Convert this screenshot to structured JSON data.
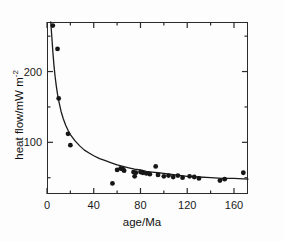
{
  "chart_data": {
    "type": "scatter",
    "title": "",
    "xlabel": "age/Ma",
    "ylabel": "heat flow/mW m",
    "ylabel_exponent": "-2",
    "xlim": [
      0,
      172
    ],
    "ylim": [
      27,
      270
    ],
    "xticks": [
      0,
      40,
      80,
      120,
      160
    ],
    "xticklabels": [
      "0",
      "40",
      "80",
      "120",
      "160"
    ],
    "xminorticks": [
      20,
      60,
      100,
      140
    ],
    "yticks": [
      100,
      200
    ],
    "yticklabels": [
      "100",
      "200"
    ],
    "yminorticks": [
      50,
      150,
      250
    ],
    "grid": false,
    "legend": null,
    "frame": "box",
    "series": [
      {
        "name": "heat flow observations",
        "marker": "filled-circle",
        "color": "#161616",
        "points": [
          [
            5,
            265
          ],
          [
            9,
            232
          ],
          [
            10,
            162
          ],
          [
            18,
            112
          ],
          [
            20,
            96
          ],
          [
            56,
            42
          ],
          [
            60,
            61
          ],
          [
            63,
            63
          ],
          [
            65,
            62
          ],
          [
            66,
            60
          ],
          [
            74,
            58
          ],
          [
            75,
            52
          ],
          [
            76,
            57
          ],
          [
            80,
            58
          ],
          [
            82,
            57
          ],
          [
            85,
            56
          ],
          [
            88,
            55
          ],
          [
            93,
            66
          ],
          [
            95,
            54
          ],
          [
            100,
            52
          ],
          [
            104,
            53
          ],
          [
            108,
            51
          ],
          [
            112,
            53
          ],
          [
            116,
            50
          ],
          [
            122,
            52
          ],
          [
            126,
            51
          ],
          [
            130,
            49
          ],
          [
            148,
            46
          ],
          [
            152,
            48
          ],
          [
            168,
            57
          ]
        ]
      },
      {
        "name": "theoretical cooling curve",
        "type": "line",
        "color": "#1b1b1b",
        "points": [
          [
            3.2,
            270
          ],
          [
            4,
            252
          ],
          [
            5,
            228
          ],
          [
            6,
            208
          ],
          [
            7,
            192
          ],
          [
            8,
            179
          ],
          [
            9,
            168
          ],
          [
            10,
            159
          ],
          [
            12,
            144
          ],
          [
            14,
            133
          ],
          [
            16,
            124
          ],
          [
            18,
            117
          ],
          [
            20,
            111
          ],
          [
            24,
            102
          ],
          [
            28,
            95
          ],
          [
            32,
            89
          ],
          [
            36,
            85
          ],
          [
            40,
            81
          ],
          [
            45,
            77
          ],
          [
            50,
            74
          ],
          [
            55,
            71
          ],
          [
            60,
            68
          ],
          [
            65,
            66
          ],
          [
            70,
            64
          ],
          [
            75,
            62
          ],
          [
            80,
            61
          ],
          [
            85,
            59
          ],
          [
            90,
            58
          ],
          [
            95,
            57
          ],
          [
            100,
            56
          ],
          [
            110,
            54
          ],
          [
            120,
            52
          ],
          [
            130,
            51
          ],
          [
            140,
            50
          ],
          [
            150,
            49
          ],
          [
            160,
            49
          ],
          [
            172,
            48
          ]
        ]
      }
    ]
  },
  "axes": {
    "x_title": "age/Ma",
    "y_title_main": "heat flow/mW m",
    "y_title_sup": "-2"
  }
}
